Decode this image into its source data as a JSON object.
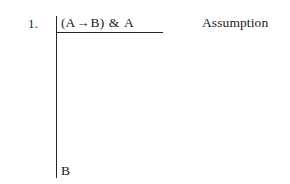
{
  "figure": {
    "kind": "fitch-style-natural-deduction-proof",
    "background_color": "#ffffff",
    "ink_color": "#262626"
  },
  "proof": {
    "rows": [
      {
        "number": "1.",
        "formula": {
          "open_paren": "(",
          "antecedent": "A",
          "connective_arrow": "→",
          "consequent": "B",
          "close_paren": ")",
          "connective_conjunction": "&",
          "right_conjunct": "A",
          "full_text": "(A → B) & A"
        },
        "justification": "Assumption"
      }
    ],
    "goal": {
      "formula": "B"
    }
  }
}
